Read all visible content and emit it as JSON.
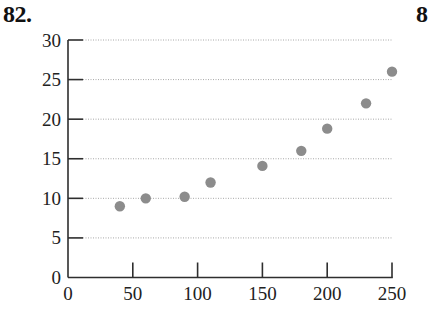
{
  "problem_label": "82.",
  "next_problem_label_partial": "8",
  "colors": {
    "axis": "#2e2e2e",
    "grid": "#a8a8a8",
    "point": "#8c8c8c",
    "text": "#222222"
  },
  "chart_data": {
    "type": "scatter",
    "title": "",
    "xlabel": "",
    "ylabel": "",
    "xlim": [
      0,
      250
    ],
    "ylim": [
      0,
      30
    ],
    "xticks": [
      0,
      50,
      100,
      150,
      200,
      250
    ],
    "yticks": [
      0,
      5,
      10,
      15,
      20,
      25,
      30
    ],
    "xtick_labels": [
      "0",
      "50",
      "100",
      "150",
      "200",
      "250"
    ],
    "ytick_labels": [
      "0",
      "5",
      "10",
      "15",
      "20",
      "25",
      "30"
    ],
    "grid": {
      "horizontal": true,
      "vertical": false,
      "style": "dotted"
    },
    "legend": null,
    "points": [
      {
        "x": 40,
        "y": 9
      },
      {
        "x": 60,
        "y": 10
      },
      {
        "x": 90,
        "y": 10.2
      },
      {
        "x": 110,
        "y": 12
      },
      {
        "x": 150,
        "y": 14.1
      },
      {
        "x": 180,
        "y": 16
      },
      {
        "x": 200,
        "y": 18.8
      },
      {
        "x": 230,
        "y": 22
      },
      {
        "x": 250,
        "y": 26
      }
    ]
  }
}
